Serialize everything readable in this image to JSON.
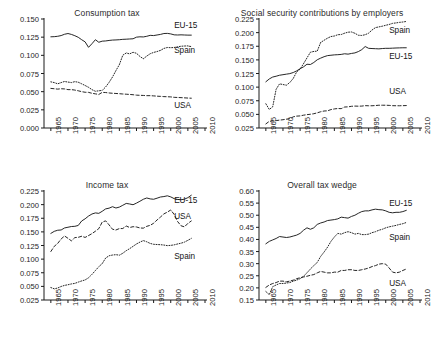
{
  "figure": {
    "panel_count": 4,
    "series_names": [
      "EU-15",
      "Spain",
      "USA"
    ],
    "x_tick_labels": [
      "1965",
      "1970",
      "1975",
      "1980",
      "1985",
      "1990",
      "1995",
      "2000",
      "2005",
      "2010"
    ],
    "line_styles": {
      "EU-15": "solid",
      "Spain": "dotted",
      "USA": "dashed"
    },
    "line_color": "#1a1a1a"
  },
  "chart_data": [
    {
      "type": "line",
      "title": "Consumption tax",
      "xlabel": "",
      "ylabel": "",
      "xlim": [
        1963,
        2010
      ],
      "ylim": [
        0.0,
        0.15
      ],
      "ytick_labels": [
        "0.000",
        "0.025",
        "0.050",
        "0.075",
        "0.100",
        "0.125",
        "0.150"
      ],
      "yticks": [
        0.0,
        0.025,
        0.05,
        0.075,
        0.1,
        0.125,
        0.15
      ],
      "xticks": [
        1965,
        1970,
        1975,
        1980,
        1985,
        1990,
        1995,
        2000,
        2005,
        2010
      ],
      "grid": false,
      "legend_position": "inline-labels",
      "x": [
        1965,
        1966,
        1967,
        1968,
        1969,
        1970,
        1971,
        1972,
        1973,
        1974,
        1975,
        1976,
        1977,
        1978,
        1979,
        1980,
        1981,
        1982,
        1983,
        1984,
        1985,
        1986,
        1987,
        1988,
        1989,
        1990,
        1991,
        1992,
        1993,
        1994,
        1995,
        1996,
        1997,
        1998,
        1999,
        2000,
        2001,
        2002,
        2003,
        2004,
        2005,
        2006
      ],
      "series": [
        {
          "name": "EU-15",
          "style": "solid",
          "label_x": 2001,
          "label_y": 0.1405,
          "values": [
            0.1255,
            0.1257,
            0.1262,
            0.1272,
            0.129,
            0.13,
            0.1288,
            0.127,
            0.1248,
            0.1215,
            0.1185,
            0.111,
            0.116,
            0.1215,
            0.118,
            0.1195,
            0.1198,
            0.1205,
            0.121,
            0.1212,
            0.1215,
            0.122,
            0.1222,
            0.1225,
            0.1228,
            0.125,
            0.1255,
            0.1253,
            0.1262,
            0.1275,
            0.1272,
            0.128,
            0.1288,
            0.13,
            0.1302,
            0.1295,
            0.1282,
            0.128,
            0.1282,
            0.128,
            0.1278,
            0.1278
          ]
        },
        {
          "name": "Spain",
          "style": "dotted",
          "label_x": 2001,
          "label_y": 0.1065,
          "values": [
            0.0635,
            0.0625,
            0.0608,
            0.0625,
            0.064,
            0.0632,
            0.0625,
            0.0638,
            0.063,
            0.0608,
            0.0585,
            0.056,
            0.0528,
            0.0505,
            0.0512,
            0.0518,
            0.0565,
            0.0628,
            0.0702,
            0.079,
            0.0872,
            0.1002,
            0.1032,
            0.102,
            0.1042,
            0.1028,
            0.0985,
            0.0952,
            0.099,
            0.1022,
            0.104,
            0.1052,
            0.1068,
            0.1095,
            0.1108,
            0.1105,
            0.1108,
            0.1118,
            0.1125,
            0.1128,
            0.113,
            0.112
          ]
        },
        {
          "name": "USA",
          "style": "dashed",
          "label_x": 2001,
          "label_y": 0.0305,
          "values": [
            0.0545,
            0.054,
            0.0535,
            0.054,
            0.0538,
            0.0528,
            0.0528,
            0.0522,
            0.0512,
            0.05,
            0.0492,
            0.049,
            0.0478,
            0.047,
            0.0462,
            0.049,
            0.0488,
            0.0482,
            0.0478,
            0.0475,
            0.0472,
            0.0468,
            0.0465,
            0.0462,
            0.0458,
            0.0452,
            0.045,
            0.0448,
            0.0445,
            0.0445,
            0.0442,
            0.0438,
            0.0435,
            0.0432,
            0.043,
            0.0428,
            0.0422,
            0.042,
            0.0418,
            0.0415,
            0.0412,
            0.041
          ]
        }
      ]
    },
    {
      "type": "line",
      "title": "Social security contributions by employers",
      "xlabel": "",
      "ylabel": "",
      "xlim": [
        1963,
        2010
      ],
      "ylim": [
        0.025,
        0.225
      ],
      "ytick_labels": [
        "0.025",
        "0.050",
        "0.075",
        "0.100",
        "0.125",
        "0.150",
        "0.175",
        "0.200",
        "0.225"
      ],
      "yticks": [
        0.025,
        0.05,
        0.075,
        0.1,
        0.125,
        0.15,
        0.175,
        0.2,
        0.225
      ],
      "xticks": [
        1965,
        1970,
        1975,
        1980,
        1985,
        1990,
        1995,
        2000,
        2005,
        2010
      ],
      "grid": false,
      "legend_position": "inline-labels",
      "x": [
        1965,
        1966,
        1967,
        1968,
        1969,
        1970,
        1971,
        1972,
        1973,
        1974,
        1975,
        1976,
        1977,
        1978,
        1979,
        1980,
        1981,
        1982,
        1983,
        1984,
        1985,
        1986,
        1987,
        1988,
        1989,
        1990,
        1991,
        1992,
        1993,
        1994,
        1995,
        1996,
        1997,
        1998,
        1999,
        2000,
        2001,
        2002,
        2003,
        2004,
        2005,
        2006
      ],
      "series": [
        {
          "name": "Spain",
          "style": "dotted",
          "label_x": 2001,
          "label_y": 0.2035,
          "values": [
            0.0695,
            0.059,
            0.064,
            0.096,
            0.106,
            0.1048,
            0.1035,
            0.1085,
            0.116,
            0.128,
            0.133,
            0.143,
            0.1535,
            0.164,
            0.1655,
            0.166,
            0.182,
            0.186,
            0.1898,
            0.1928,
            0.1938,
            0.1962,
            0.1965,
            0.199,
            0.2008,
            0.2012,
            0.1988,
            0.1952,
            0.1948,
            0.1962,
            0.199,
            0.2048,
            0.2092,
            0.2105,
            0.2118,
            0.2135,
            0.215,
            0.217,
            0.2178,
            0.2188,
            0.2195,
            0.2205
          ]
        },
        {
          "name": "EU-15",
          "style": "solid",
          "label_x": 2001,
          "label_y": 0.1555,
          "values": [
            0.1098,
            0.115,
            0.1185,
            0.12,
            0.1218,
            0.1228,
            0.1238,
            0.1248,
            0.1268,
            0.1298,
            0.1338,
            0.1372,
            0.142,
            0.1415,
            0.1452,
            0.1502,
            0.1532,
            0.1558,
            0.1578,
            0.1585,
            0.1592,
            0.1595,
            0.16,
            0.1612,
            0.1605,
            0.1618,
            0.1628,
            0.1652,
            0.1688,
            0.1745,
            0.1712,
            0.1708,
            0.1705,
            0.1702,
            0.1708,
            0.1712,
            0.1712,
            0.1715,
            0.1718,
            0.172,
            0.1722,
            0.1722
          ]
        },
        {
          "name": "USA",
          "style": "dashed",
          "label_x": 2001,
          "label_y": 0.0905,
          "values": [
            0.0325,
            0.0372,
            0.0378,
            0.0385,
            0.0395,
            0.0402,
            0.0412,
            0.042,
            0.0455,
            0.0468,
            0.0472,
            0.0485,
            0.0495,
            0.0502,
            0.0512,
            0.0528,
            0.0548,
            0.0562,
            0.0565,
            0.0588,
            0.06,
            0.0608,
            0.0605,
            0.0635,
            0.0638,
            0.0648,
            0.0652,
            0.065,
            0.0652,
            0.066,
            0.0658,
            0.0658,
            0.0662,
            0.0668,
            0.0668,
            0.0668,
            0.0665,
            0.066,
            0.0658,
            0.0658,
            0.066,
            0.0662
          ]
        }
      ]
    },
    {
      "type": "line",
      "title": "Income tax",
      "xlabel": "",
      "ylabel": "",
      "xlim": [
        1963,
        2010
      ],
      "ylim": [
        0.025,
        0.225
      ],
      "ytick_labels": [
        "0.025",
        "0.050",
        "0.075",
        "0.100",
        "0.125",
        "0.150",
        "0.175",
        "0.200",
        "0.225"
      ],
      "yticks": [
        0.025,
        0.05,
        0.075,
        0.1,
        0.125,
        0.15,
        0.175,
        0.2,
        0.225
      ],
      "xticks": [
        1965,
        1970,
        1975,
        1980,
        1985,
        1990,
        1995,
        2000,
        2005,
        2010
      ],
      "grid": false,
      "legend_position": "inline-labels",
      "x": [
        1965,
        1966,
        1967,
        1968,
        1969,
        1970,
        1971,
        1972,
        1973,
        1974,
        1975,
        1976,
        1977,
        1978,
        1979,
        1980,
        1981,
        1982,
        1983,
        1984,
        1985,
        1986,
        1987,
        1988,
        1989,
        1990,
        1991,
        1992,
        1993,
        1994,
        1995,
        1996,
        1997,
        1998,
        1999,
        2000,
        2001,
        2002,
        2003,
        2004,
        2005,
        2006
      ],
      "series": [
        {
          "name": "EU-15",
          "style": "solid",
          "label_x": 2001,
          "label_y": 0.2075,
          "values": [
            0.1472,
            0.151,
            0.153,
            0.1535,
            0.1572,
            0.1585,
            0.1598,
            0.1602,
            0.1618,
            0.17,
            0.174,
            0.179,
            0.1828,
            0.1848,
            0.184,
            0.1878,
            0.1922,
            0.1935,
            0.1962,
            0.1938,
            0.1955,
            0.1988,
            0.2022,
            0.2012,
            0.1998,
            0.2028,
            0.2062,
            0.2098,
            0.2122,
            0.2105,
            0.2098,
            0.2118,
            0.214,
            0.2148,
            0.2162,
            0.2142,
            0.211,
            0.2095,
            0.209,
            0.21,
            0.2128,
            0.2172
          ]
        },
        {
          "name": "USA",
          "style": "dashed",
          "label_x": 2001,
          "label_y": 0.1765,
          "values": [
            0.114,
            0.1235,
            0.1288,
            0.137,
            0.1425,
            0.1382,
            0.1335,
            0.1395,
            0.14,
            0.142,
            0.1398,
            0.1432,
            0.1468,
            0.1512,
            0.156,
            0.168,
            0.1702,
            0.1628,
            0.1548,
            0.1535,
            0.156,
            0.1562,
            0.1608,
            0.158,
            0.1595,
            0.159,
            0.1572,
            0.1568,
            0.1602,
            0.162,
            0.1658,
            0.1718,
            0.1772,
            0.183,
            0.1862,
            0.1902,
            0.182,
            0.169,
            0.1612,
            0.1592,
            0.1655,
            0.17
          ]
        },
        {
          "name": "Spain",
          "style": "dotted",
          "label_x": 2001,
          "label_y": 0.1035,
          "values": [
            0.0478,
            0.0455,
            0.047,
            0.0498,
            0.0518,
            0.053,
            0.0545,
            0.0555,
            0.0578,
            0.06,
            0.0618,
            0.0658,
            0.072,
            0.079,
            0.0862,
            0.0918,
            0.102,
            0.1062,
            0.1075,
            0.1082,
            0.1072,
            0.1108,
            0.1155,
            0.1192,
            0.1235,
            0.1278,
            0.1312,
            0.134,
            0.1318,
            0.1288,
            0.1272,
            0.1268,
            0.1265,
            0.1258,
            0.1248,
            0.1252,
            0.1262,
            0.1278,
            0.1292,
            0.1312,
            0.1345,
            0.138
          ]
        }
      ]
    },
    {
      "type": "line",
      "title": "Overall tax wedge",
      "xlabel": "",
      "ylabel": "",
      "xlim": [
        1963,
        2010
      ],
      "ylim": [
        0.15,
        0.6
      ],
      "ytick_labels": [
        "0.15",
        "0.20",
        "0.25",
        "0.30",
        "0.35",
        "0.40",
        "0.45",
        "0.50",
        "0.55",
        "0.60"
      ],
      "yticks": [
        0.15,
        0.2,
        0.25,
        0.3,
        0.35,
        0.4,
        0.45,
        0.5,
        0.55,
        0.6
      ],
      "xticks": [
        1965,
        1970,
        1975,
        1980,
        1985,
        1990,
        1995,
        2000,
        2005,
        2010
      ],
      "grid": false,
      "legend_position": "inline-labels",
      "x": [
        1965,
        1966,
        1967,
        1968,
        1969,
        1970,
        1971,
        1972,
        1973,
        1974,
        1975,
        1976,
        1977,
        1978,
        1979,
        1980,
        1981,
        1982,
        1983,
        1984,
        1985,
        1986,
        1987,
        1988,
        1989,
        1990,
        1991,
        1992,
        1993,
        1994,
        1995,
        1996,
        1997,
        1998,
        1999,
        2000,
        2001,
        2002,
        2003,
        2004,
        2005,
        2006
      ],
      "series": [
        {
          "name": "EU-15",
          "style": "solid",
          "label_x": 2001,
          "label_y": 0.548,
          "values": [
            0.382,
            0.392,
            0.398,
            0.404,
            0.412,
            0.41,
            0.408,
            0.41,
            0.414,
            0.418,
            0.425,
            0.438,
            0.448,
            0.442,
            0.448,
            0.462,
            0.468,
            0.472,
            0.478,
            0.48,
            0.482,
            0.485,
            0.492,
            0.49,
            0.488,
            0.495,
            0.5,
            0.508,
            0.515,
            0.518,
            0.518,
            0.522,
            0.525,
            0.523,
            0.522,
            0.518,
            0.512,
            0.51,
            0.512,
            0.512,
            0.515,
            0.52
          ]
        },
        {
          "name": "Spain",
          "style": "dotted",
          "label_x": 2001,
          "label_y": 0.405,
          "values": [
            0.185,
            0.172,
            0.205,
            0.212,
            0.218,
            0.218,
            0.22,
            0.222,
            0.228,
            0.232,
            0.238,
            0.248,
            0.262,
            0.278,
            0.292,
            0.305,
            0.33,
            0.348,
            0.368,
            0.392,
            0.41,
            0.425,
            0.422,
            0.428,
            0.432,
            0.428,
            0.422,
            0.425,
            0.42,
            0.42,
            0.422,
            0.428,
            0.432,
            0.438,
            0.442,
            0.448,
            0.452,
            0.455,
            0.458,
            0.462,
            0.465,
            0.47
          ]
        },
        {
          "name": "USA",
          "style": "dashed",
          "label_x": 2001,
          "label_y": 0.218,
          "values": [
            0.202,
            0.212,
            0.218,
            0.222,
            0.228,
            0.228,
            0.225,
            0.228,
            0.232,
            0.238,
            0.242,
            0.245,
            0.248,
            0.252,
            0.255,
            0.262,
            0.268,
            0.265,
            0.262,
            0.262,
            0.265,
            0.265,
            0.272,
            0.272,
            0.275,
            0.275,
            0.272,
            0.272,
            0.275,
            0.278,
            0.282,
            0.288,
            0.292,
            0.298,
            0.3,
            0.298,
            0.282,
            0.265,
            0.262,
            0.265,
            0.272,
            0.278
          ]
        }
      ]
    }
  ]
}
